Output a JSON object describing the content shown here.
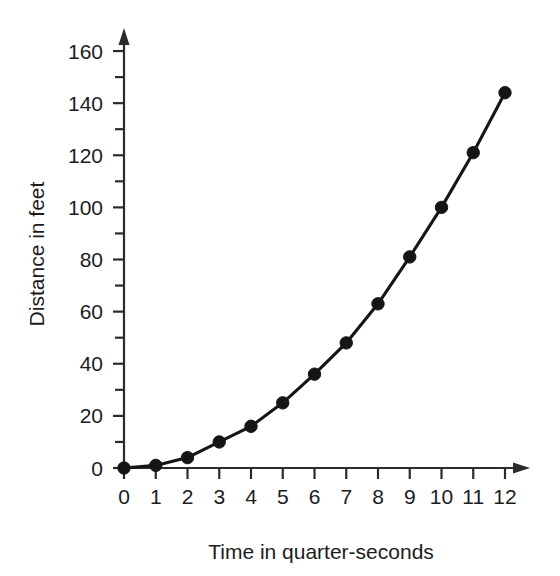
{
  "chart_data": {
    "type": "line",
    "title": "",
    "xlabel": "Time in quarter-seconds",
    "ylabel": "Distance in feet",
    "x": [
      0,
      1,
      2,
      3,
      4,
      5,
      6,
      7,
      8,
      9,
      10,
      11,
      12
    ],
    "values": [
      0,
      1,
      4,
      10,
      16,
      25,
      36,
      48,
      63,
      81,
      100,
      121,
      144
    ],
    "series": [
      {
        "name": "Distance",
        "values": [
          0,
          1,
          4,
          10,
          16,
          25,
          36,
          48,
          63,
          81,
          100,
          121,
          144
        ]
      }
    ],
    "xlim": [
      0,
      12
    ],
    "ylim": [
      0,
      165
    ],
    "x_tick_labels": [
      "0",
      "1",
      "2",
      "3",
      "4",
      "5",
      "6",
      "7",
      "8",
      "9",
      "10",
      "11",
      "12"
    ],
    "x_tick_values": [
      0,
      1,
      2,
      3,
      4,
      5,
      6,
      7,
      8,
      9,
      10,
      11,
      12
    ],
    "y_tick_labels": [
      "0",
      "20",
      "40",
      "60",
      "80",
      "100",
      "120",
      "140",
      "160"
    ],
    "y_tick_values": [
      0,
      20,
      40,
      60,
      80,
      100,
      120,
      140,
      160
    ],
    "y_minor_tick_values": [
      10,
      30,
      50,
      70,
      90,
      110,
      130,
      150
    ],
    "grid": false,
    "legend": "none",
    "marker": "filled-circle",
    "line_color": "#151515",
    "marker_color": "#151515",
    "axis_color": "#2b2b2b",
    "background_color": "#ffffff",
    "x_axis_arrow": true,
    "y_axis_arrow": true
  }
}
